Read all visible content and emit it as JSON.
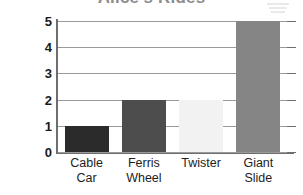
{
  "chart_data": {
    "type": "bar",
    "title": "Alice's Rides",
    "xlabel": "",
    "ylabel": "NUMBER OF RIDES",
    "categories": [
      "Cable Car",
      "Ferris Wheel",
      "Twister",
      "Giant Slide"
    ],
    "values": [
      1,
      2,
      2,
      5
    ],
    "ylim": [
      0,
      5
    ],
    "y_ticks": [
      "5",
      "4",
      "3",
      "2",
      "1",
      "0"
    ],
    "grid": true,
    "legend": "none",
    "bars": [
      {
        "label_line1": "Cable",
        "label_line2": "Car",
        "value": 1,
        "color": "#2b2b2b"
      },
      {
        "label_line1": "Ferris",
        "label_line2": "Wheel",
        "value": 2,
        "color": "#4d4d4d"
      },
      {
        "label_line1": "Twister",
        "label_line2": "",
        "value": 2,
        "color": "#f2f2f2"
      },
      {
        "label_line1": "Giant",
        "label_line2": "Slide",
        "value": 5,
        "color": "#858585"
      }
    ]
  },
  "colors": {
    "axis": "#6e6e6e",
    "grid": "#9a9a9a",
    "title": "#8d8d8d",
    "tick_text": "#1a1a1a",
    "label_text": "#1d1d1d"
  }
}
